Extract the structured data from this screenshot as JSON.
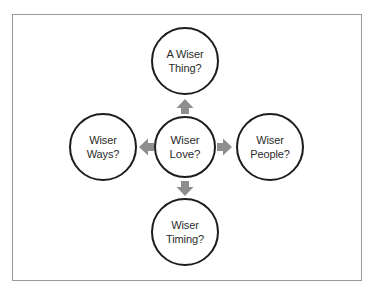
{
  "diagram": {
    "frame": {
      "border_color": "#9a9a9a",
      "background_color": "#ffffff"
    },
    "style": {
      "circle_stroke_color": "#1d1d1d",
      "circle_fill_color": "#ffffff",
      "text_color": "#2b2b2b",
      "arrow_color": "#8e8e8e"
    },
    "center_node": {
      "id": "wiser-love",
      "line1": "Wiser",
      "line2": "Love?",
      "full_label": "Wiser Love?"
    },
    "nodes": [
      {
        "id": "a-wiser-thing",
        "position": "top",
        "line1": "A Wiser",
        "line2": "Thing?",
        "full_label": "A Wiser Thing?"
      },
      {
        "id": "wiser-people",
        "position": "right",
        "line1": "Wiser",
        "line2": "People?",
        "full_label": "Wiser People?"
      },
      {
        "id": "wiser-timing",
        "position": "bottom",
        "line1": "Wiser",
        "line2": "Timing?",
        "full_label": "Wiser Timing?"
      },
      {
        "id": "wiser-ways",
        "position": "left",
        "line1": "Wiser",
        "line2": "Ways?",
        "full_label": "Wiser Ways?"
      }
    ],
    "arrows": [
      {
        "id": "arrow-up",
        "direction": "up",
        "from": "wiser-love",
        "to": "a-wiser-thing"
      },
      {
        "id": "arrow-right",
        "direction": "right",
        "from": "wiser-love",
        "to": "wiser-people"
      },
      {
        "id": "arrow-down",
        "direction": "down",
        "from": "wiser-love",
        "to": "wiser-timing"
      },
      {
        "id": "arrow-left",
        "direction": "left",
        "from": "wiser-love",
        "to": "wiser-ways"
      }
    ]
  }
}
